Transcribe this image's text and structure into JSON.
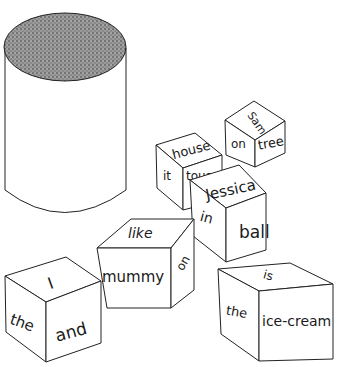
{
  "scene": {
    "description": "Line drawing of a cylindrical container with stippled lid and seven word cubes",
    "colors": {
      "ink": "#222222",
      "paper": "#ffffff"
    }
  },
  "cubes": [
    {
      "id": "cube-house",
      "top": "house",
      "left": "it",
      "right": "tous"
    },
    {
      "id": "cube-sam",
      "top": "Sam",
      "left": "on",
      "right": "tree"
    },
    {
      "id": "cube-jessica",
      "top": "Jessica",
      "left": "in",
      "right": "ball"
    },
    {
      "id": "cube-like",
      "top": "like",
      "left": "mummy",
      "right": "on"
    },
    {
      "id": "cube-i",
      "top": "I",
      "left": "the",
      "right": "and"
    },
    {
      "id": "cube-is",
      "top": "is",
      "left": "the",
      "right": "ice-cream"
    }
  ]
}
